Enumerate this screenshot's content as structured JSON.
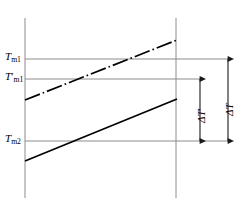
{
  "figure": {
    "type": "line-diagram",
    "width": 239,
    "height": 207,
    "background": "#ffffff"
  },
  "labels": {
    "t_m1": {
      "symbol": "T",
      "subscript": "m1",
      "prime": "",
      "text": "Tm1"
    },
    "t_m1_prime": {
      "symbol": "T",
      "subscript": "m1",
      "prime": "′",
      "text": "T′m1"
    },
    "t_m2": {
      "symbol": "T",
      "subscript": "m2",
      "prime": "",
      "text": "Tm2"
    },
    "delta_t_prime": {
      "symbol": "ΔT",
      "prime": "′",
      "text": "ΔT′"
    },
    "delta_t": {
      "symbol": "ΔT",
      "prime": "",
      "text": "ΔT"
    }
  },
  "colors": {
    "line": "#000000",
    "gridline": "#8c8c8c",
    "axis": "#8c8c8c",
    "arrow": "#1a1a1a",
    "text": "#000000"
  },
  "geometry": {
    "axis_left_x": 25,
    "axis_right_x": 176,
    "axis_top_y": 18,
    "axis_bottom_y": 198,
    "gridline_right_x": 231,
    "y_t_m1": 59,
    "y_t_m1_prime": 79,
    "y_t_m2": 141,
    "upper_line": {
      "x1": 25,
      "y1": 100,
      "x2": 177,
      "y2": 40,
      "style": "dash-dot"
    },
    "lower_line": {
      "x1": 25,
      "y1": 161,
      "x2": 177,
      "y2": 99,
      "style": "solid"
    },
    "arrow_delta_t_prime_x": 200,
    "arrow_delta_t_x": 228,
    "arrow_delta_t_prime_top_y": 79,
    "arrow_delta_t_prime_bottom_y": 141,
    "arrow_delta_t_top_y": 59,
    "arrow_delta_t_bottom_y": 141
  }
}
